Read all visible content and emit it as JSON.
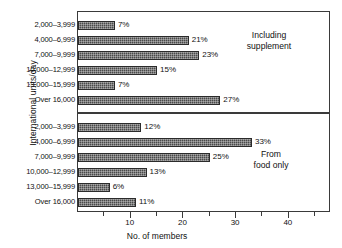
{
  "chart_data": {
    "type": "bar",
    "orientation": "horizontal",
    "title": "",
    "xlabel": "No. of members",
    "ylabel": "International units/day",
    "xlim": [
      0,
      48
    ],
    "grid": false,
    "categories": [
      "2,000–3,999",
      "4,000–6,999",
      "7,000–9,999",
      "10,000–12,999",
      "13,000–15,999",
      "Over 16,000"
    ],
    "xticks_major": [
      10,
      20,
      30,
      40
    ],
    "xticks_minor": [
      5,
      15,
      25,
      35,
      45
    ],
    "xtick_labels": [
      "10",
      "20",
      "30",
      "40"
    ],
    "panels": [
      {
        "id": "including-supplement",
        "note": "Including\nsupplement",
        "values": [
          7,
          21,
          23,
          15,
          7,
          27
        ],
        "value_labels": [
          "7%",
          "21%",
          "23%",
          "15%",
          "7%",
          "27%"
        ]
      },
      {
        "id": "from-food-only",
        "note": "From\nfood only",
        "values": [
          12,
          33,
          25,
          13,
          6,
          11
        ],
        "value_labels": [
          "12%",
          "33%",
          "25%",
          "13%",
          "6%",
          "11%"
        ]
      }
    ],
    "bar_color": "#4a4a4a",
    "frame_color": "#3a3a3a"
  }
}
